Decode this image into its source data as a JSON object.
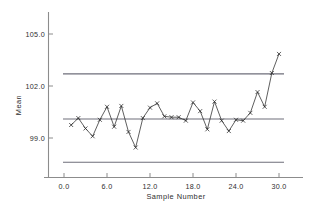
{
  "chart_data": {
    "type": "line",
    "title": "",
    "subtitle": "",
    "xlabel": "Sample  Number",
    "ylabel": "Mean",
    "xlim": [
      -1.2,
      32.5
    ],
    "ylim": [
      96.2,
      106.3
    ],
    "xticks": [
      0.0,
      6.0,
      12.0,
      18.0,
      24.0,
      30.0
    ],
    "xticklabels": [
      "0.0",
      "6.0",
      "12.0",
      "18.0",
      "24.0",
      "30.0"
    ],
    "yticks": [
      99.0,
      102.0,
      105.0
    ],
    "yticklabels": [
      "99.0",
      "102.0",
      "105.0"
    ],
    "grid": false,
    "legend": false,
    "legend_position": "none",
    "marker": "x",
    "x": [
      1,
      2,
      3,
      4,
      5,
      6,
      7,
      8,
      9,
      10,
      11,
      12,
      13,
      14,
      15,
      16,
      17,
      18,
      19,
      20,
      21,
      22,
      23,
      24,
      25,
      26,
      27,
      28,
      29,
      30
    ],
    "values": [
      99.75,
      100.15,
      99.55,
      99.1,
      100.05,
      100.8,
      99.65,
      100.85,
      99.35,
      98.45,
      100.15,
      100.75,
      101.0,
      100.25,
      100.2,
      100.2,
      100.0,
      101.05,
      100.55,
      99.5,
      101.1,
      100.0,
      99.4,
      100.05,
      100.0,
      100.45,
      101.65,
      100.8,
      102.75,
      103.85
    ],
    "series": [
      {
        "name": "Mean",
        "values": [
          99.75,
          100.15,
          99.55,
          99.1,
          100.05,
          100.8,
          99.65,
          100.85,
          99.35,
          98.45,
          100.15,
          100.75,
          101.0,
          100.25,
          100.2,
          100.2,
          100.0,
          101.05,
          100.55,
          99.5,
          101.1,
          100.0,
          99.4,
          100.05,
          100.0,
          100.45,
          101.65,
          100.8,
          102.75,
          103.85
        ]
      }
    ],
    "reference_lines": [
      {
        "name": "UCL",
        "value": 102.7,
        "label": ""
      },
      {
        "name": "CL",
        "value": 100.1,
        "label": ""
      },
      {
        "name": "LCL",
        "value": 97.6,
        "label": ""
      }
    ],
    "colors": {
      "series": "#2a2a2a",
      "control_lines": "#6e6e7a",
      "axis": "#8c8c8c",
      "text": "#2e2e2e",
      "background": "#ffffff"
    }
  }
}
